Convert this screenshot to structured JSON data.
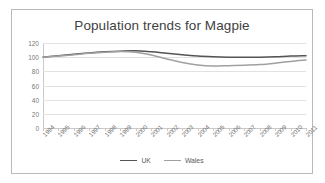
{
  "chart_data": {
    "type": "line",
    "title": "Population trends for Magpie",
    "xlabel": "",
    "ylabel": "",
    "ylim": [
      0,
      120
    ],
    "ytick_step": 20,
    "yticks": [
      "0",
      "20",
      "40",
      "60",
      "80",
      "100",
      "120"
    ],
    "grid": true,
    "legend_position": "bottom",
    "categories": [
      "1994",
      "1995",
      "1996",
      "1997",
      "1998",
      "1999",
      "2000",
      "2001",
      "2002",
      "2003",
      "2004",
      "2005",
      "2006",
      "2007",
      "2008",
      "2009",
      "2010",
      "2011"
    ],
    "series": [
      {
        "name": "UK",
        "color": "#545454",
        "values": [
          100,
          102,
          104,
          106,
          107.5,
          108.5,
          109,
          107.5,
          105.5,
          103.5,
          101.5,
          100.5,
          100,
          100,
          100,
          100.5,
          101.5,
          102
        ]
      },
      {
        "name": "Wales",
        "color": "#a0a0a0",
        "values": [
          100,
          101.5,
          103.5,
          105.5,
          107,
          108,
          107,
          103,
          97.5,
          92.5,
          89,
          87.5,
          88,
          88.5,
          89.5,
          91.5,
          94,
          96
        ]
      }
    ]
  },
  "legend": {
    "items": [
      {
        "label": "UK",
        "color": "#545454"
      },
      {
        "label": "Wales",
        "color": "#a0a0a0"
      }
    ]
  },
  "colors": {
    "frame_border": "#b9b9b9",
    "gridline": "#e2e2e2",
    "axis": "#c9c9c9",
    "title_text": "#3f3f3f",
    "tick_text": "#7a7a7a",
    "background": "#ffffff"
  }
}
